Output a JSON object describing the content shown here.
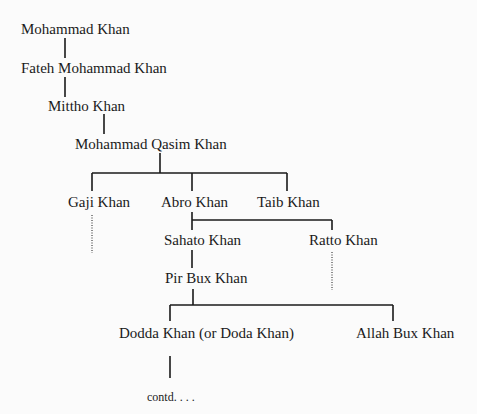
{
  "tree": {
    "nodes": {
      "mohammad_khan": "Mohammad Khan",
      "fateh_mohammad_khan": "Fateh Mohammad Khan",
      "mittho_khan": "Mittho Khan",
      "mohammad_qasim_khan": "Mohammad Qasim Khan",
      "gaji_khan": "Gaji Khan",
      "abro_khan": "Abro Khan",
      "taib_khan": "Taib Khan",
      "sahato_khan": "Sahato Khan",
      "ratto_khan": "Ratto Khan",
      "pir_bux_khan": "Pir Bux Khan",
      "dodda_khan": "Dodda Khan (or Doda Khan)",
      "allah_bux_khan": "Allah Bux Khan",
      "contd": "contd. . . ."
    },
    "edges": [
      [
        "Mohammad Khan",
        "Fateh Mohammad Khan"
      ],
      [
        "Fateh Mohammad Khan",
        "Mittho Khan"
      ],
      [
        "Mittho Khan",
        "Mohammad Qasim Khan"
      ],
      [
        "Mohammad Qasim Khan",
        "Gaji Khan"
      ],
      [
        "Mohammad Qasim Khan",
        "Abro Khan"
      ],
      [
        "Mohammad Qasim Khan",
        "Taib Khan"
      ],
      [
        "Abro Khan",
        "Sahato Khan"
      ],
      [
        "Abro Khan",
        "Ratto Khan"
      ],
      [
        "Sahato Khan",
        "Pir Bux Khan"
      ],
      [
        "Pir Bux Khan",
        "Dodda Khan (or Doda Khan)"
      ],
      [
        "Pir Bux Khan",
        "Allah Bux Khan"
      ],
      [
        "Dodda Khan (or Doda Khan)",
        "contd. . . ."
      ]
    ],
    "line_color": "#1a1a1a"
  }
}
